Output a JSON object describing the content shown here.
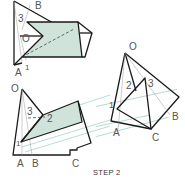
{
  "caption": "STEP 2",
  "colors": {
    "shaded_face": "#cfe3da",
    "edge": "#1a1a1a",
    "construction_line": "#8cc5b8",
    "label": "#555555"
  },
  "figures": {
    "top_left": {
      "labels": {
        "B": "B",
        "three": "3",
        "O": "O",
        "A": "A",
        "one": "1"
      }
    },
    "right": {
      "labels": {
        "O": "O",
        "two": "2",
        "three": "3",
        "one": "1",
        "A": "A",
        "C": "C",
        "B": "B"
      }
    },
    "bottom_left": {
      "labels": {
        "O": "O",
        "three": "3",
        "two": "2",
        "one": "1",
        "A": "A",
        "B": "B",
        "C": "C"
      }
    }
  }
}
